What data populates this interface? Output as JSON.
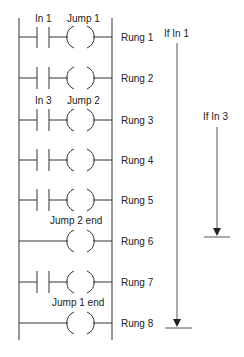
{
  "diagram": {
    "colors": {
      "line": "#333333",
      "text": "#222222",
      "background": "#ffffff"
    },
    "rungs": [
      {
        "label": "Rung 1",
        "contact": "In 1",
        "coil": "Jump 1",
        "has_contact": true
      },
      {
        "label": "Rung 2",
        "contact": "",
        "coil": "",
        "has_contact": true
      },
      {
        "label": "Rung 3",
        "contact": "In 3",
        "coil": "Jump 2",
        "has_contact": true
      },
      {
        "label": "Rung 4",
        "contact": "",
        "coil": "",
        "has_contact": true
      },
      {
        "label": "Rung 5",
        "contact": "",
        "coil": "",
        "has_contact": true
      },
      {
        "label": "Rung 6",
        "contact": "",
        "coil": "Jump 2 end",
        "has_contact": false
      },
      {
        "label": "Rung 7",
        "contact": "",
        "coil": "",
        "has_contact": true
      },
      {
        "label": "Rung 8",
        "contact": "",
        "coil": "Jump 1 end",
        "has_contact": false
      }
    ],
    "arrows": [
      {
        "label": "If In 1",
        "from_rung": "Rung 1",
        "to_rung": "Rung 8"
      },
      {
        "label": "If In 3",
        "from_rung": "Rung 3",
        "to_rung": "Rung 6"
      }
    ]
  }
}
